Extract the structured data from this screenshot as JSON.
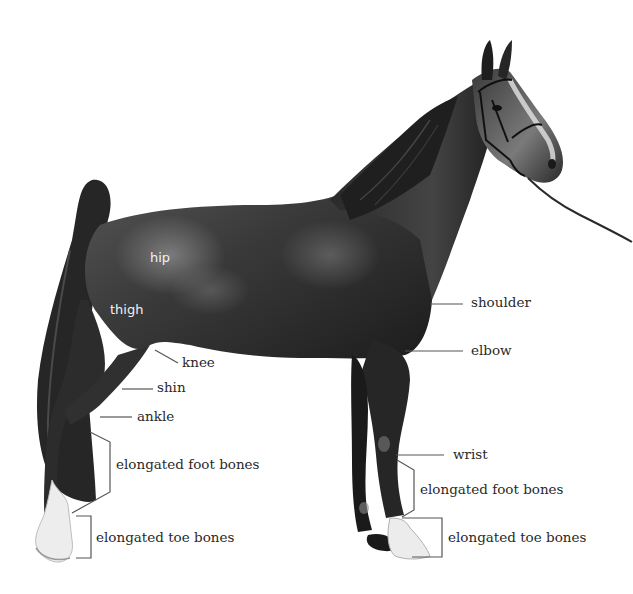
{
  "diagram": {
    "colors": {
      "background": "#ffffff",
      "coat": "#2b2b2b",
      "coat_highlight": "#6a6a6a",
      "leader_line": "#555555",
      "label_text": "#2a2a2a",
      "inside_label_text": "#f2f2f2",
      "white_socks": "#ececec"
    },
    "labels": {
      "hip": "hip",
      "thigh": "thigh",
      "knee": "knee",
      "shin": "shin",
      "ankle": "ankle",
      "hind_foot_bones": "elongated foot bones",
      "hind_toe_bones": "elongated toe bones",
      "shoulder": "shoulder",
      "elbow": "elbow",
      "wrist": "wrist",
      "fore_foot_bones": "elongated foot bones",
      "fore_toe_bones": "elongated toe bones"
    }
  }
}
